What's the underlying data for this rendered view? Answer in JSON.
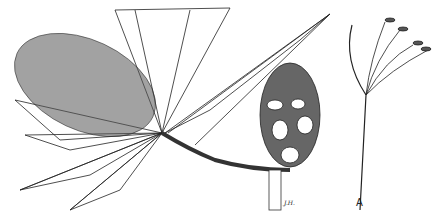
{
  "illustration": {
    "subject": "botanical line drawing of a Banksia branch with serrated leaves, flower spike, seed cone, and flower detail",
    "labels": {
      "signature": "J.H.",
      "detail_label": "A"
    },
    "colors": {
      "ink": "#222222",
      "paper": "#ffffff"
    }
  }
}
